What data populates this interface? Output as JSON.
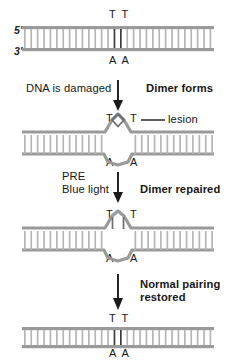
{
  "figure": {
    "colors": {
      "backbone": "#9a9a9a",
      "rung": "#b3b3b3",
      "rung_dark": "#3d3d3d",
      "text": "#161616",
      "arrow": "#1a1a1a"
    }
  },
  "panels": [
    {
      "id": "panel-undamaged",
      "label_five_prime": "5′",
      "label_three_prime": "3′",
      "top_bases": "T T",
      "bottom_bases": "A A",
      "state": "normal"
    },
    {
      "id": "panel-dimer",
      "top_base_left": "T",
      "top_base_right": "T",
      "bottom_base_left": "A",
      "bottom_base_right": "A",
      "annotation": "lesion",
      "state": "dimer"
    },
    {
      "id": "panel-repaired",
      "top_base_left": "T",
      "top_base_right": "T",
      "bottom_base_left": "A",
      "bottom_base_right": "A",
      "state": "repaired"
    },
    {
      "id": "panel-restored",
      "top_bases": "T T",
      "bottom_bases": "A A",
      "state": "normal"
    }
  ],
  "steps": [
    {
      "id": "step-1",
      "left_text": "DNA is damaged",
      "right_text": "Dimer forms",
      "right_bold": true
    },
    {
      "id": "step-2",
      "left_line1": "PRE",
      "left_line2": "Blue light",
      "right_text": "Dimer repaired",
      "right_bold": true
    },
    {
      "id": "step-3",
      "right_line1": "Normal pairing",
      "right_line2": "restored",
      "right_bold": true
    }
  ]
}
